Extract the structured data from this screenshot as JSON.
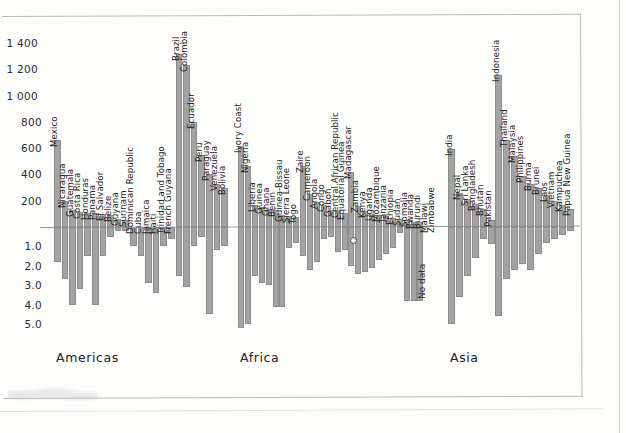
{
  "chart_data": {
    "type": "bar",
    "title": "",
    "subtitle": "",
    "xlabel": "",
    "ylabel": "",
    "grid": false,
    "legend_position": "none",
    "orientation": "vertical",
    "note": "Diverging bar chart of countries grouped by continent; positive values above the zero line use a thousands scale, negative values below the zero line use a units scale.",
    "y_axis": {
      "ticks_above_zero": [
        "1 400",
        "1 200",
        "1 000",
        "800",
        "600",
        "400",
        "200"
      ],
      "ticks_above_zero_values": [
        1400,
        1200,
        1000,
        800,
        600,
        400,
        200
      ],
      "ticks_below_zero": [
        "1.0",
        "2.0",
        "3.0",
        "4.0",
        "5.0"
      ],
      "ticks_below_zero_values": [
        1.0,
        2.0,
        3.0,
        4.0,
        5.0
      ],
      "zero_label": "0",
      "ylim_above": [
        0,
        1500
      ],
      "ylim_below": [
        0,
        5.5
      ]
    },
    "regions": [
      {
        "name": "Americas",
        "label": "Americas",
        "categories": [
          "Mexico",
          "Nicaragua",
          "Guatemala",
          "Costa Rica",
          "Honduras",
          "Panama",
          "El Salvador",
          "Belize",
          "Guyana",
          "Surinam",
          "Dominican Republic",
          "Cuba",
          "Jamaica",
          "Haiti",
          "Trinidad and Tobago",
          "French Guyana",
          "Brazil",
          "Colombia",
          "Ecuador",
          "Peru",
          "Paraguay",
          "Venezuela",
          "Bolivia"
        ],
        "values_pos": [
          660,
          200,
          130,
          115,
          105,
          105,
          100,
          95,
          60,
          55,
          0,
          0,
          0,
          0,
          0,
          0,
          1320,
          1230,
          800,
          545,
          400,
          325,
          300
        ],
        "values_neg": [
          1.8,
          2.7,
          4.0,
          3.2,
          1.5,
          4.0,
          1.5,
          0.5,
          0.2,
          0.2,
          1.0,
          1.5,
          2.9,
          3.4,
          1.0,
          0.6,
          2.5,
          3.1,
          1.0,
          0.5,
          4.5,
          1.2,
          1.0
        ]
      },
      {
        "name": "Africa",
        "label": "Africa",
        "categories": [
          "Ivory Coast",
          "Nigeria",
          "Liberia",
          "Guinea",
          "Ghana",
          "Benin",
          "Guinea-Bissau",
          "Sierra Leone",
          "Togo",
          "Zaire",
          "Cameroon",
          "Angola",
          "Congo",
          "Gabon",
          "Central African Republic",
          "Equatorial Guinea",
          "Madagascar",
          "Zambia",
          "Kenya",
          "Uganda",
          "Mozambique",
          "Tanzania",
          "Ethiopia",
          "Sudan",
          "Somalia",
          "Rwanda",
          "Burundi",
          "Malawi",
          "Zimbabwe"
        ],
        "values_pos": [
          620,
          465,
          170,
          150,
          140,
          130,
          95,
          85,
          75,
          465,
          250,
          190,
          170,
          130,
          120,
          110,
          420,
          160,
          120,
          100,
          90,
          85,
          70,
          60,
          50,
          40,
          35,
          0,
          0
        ],
        "values_neg": [
          5.2,
          5.0,
          2.5,
          2.9,
          3.0,
          4.1,
          4.1,
          1.1,
          0.8,
          1.5,
          2.2,
          1.8,
          0.6,
          0.5,
          1.3,
          1.2,
          2.0,
          2.4,
          2.3,
          2.1,
          1.7,
          1.4,
          1.1,
          0.3,
          3.8,
          3.8,
          3.8,
          0,
          0
        ],
        "no_data": [
          "Malawi",
          "Zimbabwe"
        ],
        "no_data_label": "No data",
        "annotations": [
          {
            "type": "circle-marker",
            "near": "Madagascar",
            "label": "o"
          }
        ]
      },
      {
        "name": "Asia",
        "label": "Asia",
        "categories": [
          "India",
          "Nepal",
          "Sri Lanka",
          "Bangladesh",
          "Bhutan",
          "Pakistan",
          "Indonesia",
          "Thailand",
          "Malaysia",
          "Philippines",
          "Burma",
          "Brunei",
          "Laos",
          "Vietnam",
          "Kampuchea",
          "Papua New Guinea"
        ],
        "values_pos": [
          590,
          260,
          215,
          175,
          135,
          55,
          1160,
          660,
          540,
          390,
          330,
          300,
          245,
          200,
          165,
          140
        ],
        "values_neg": [
          5.0,
          3.6,
          2.5,
          1.6,
          0.6,
          0.9,
          4.6,
          2.7,
          2.2,
          1.9,
          2.2,
          1.4,
          0.8,
          0.6,
          0.4,
          0.2
        ]
      }
    ]
  },
  "colors": {
    "bar_fill": "#a3a3a3",
    "bar_stroke": "#8c8c8c",
    "axis_line": "#9a9a9a",
    "frame": "#b9b9b9",
    "text": "#1f1f1f",
    "background": "#fdfdfc"
  }
}
